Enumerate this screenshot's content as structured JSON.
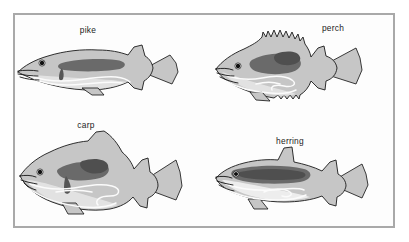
{
  "figure": {
    "type": "anatomical-diagram",
    "background_color": "#ffffff",
    "panel_background": "#fdfdfd",
    "frame_color": "#a9a9a9",
    "frame": {
      "x": 13,
      "y": 13,
      "width": 382,
      "height": 215,
      "stroke_width": 2
    },
    "palette": {
      "body_fill": "#c6c6c6",
      "body_outline": "#1a1a1a",
      "belly_pale": "#e4e4e4",
      "organ_dark": "#6a6a6a",
      "organ_darker": "#4f4f4f",
      "gut_white": "#fbfbfb",
      "label_text": "#1c1c1c",
      "eye_pupil": "#111111"
    },
    "specimens": [
      {
        "id": "pike",
        "label": "pike",
        "label_x": 88,
        "label_y": 33,
        "body_shape": "elongated torpedo",
        "dorsal_fin": "single posterior soft fin",
        "organ_note": "short straight dark gut",
        "quadrant": "top-left"
      },
      {
        "id": "perch",
        "label": "perch",
        "label_x": 333,
        "label_y": 31,
        "body_shape": "deep-bodied",
        "dorsal_fin": "spiny serrated dorsal fin",
        "organ_note": "large dark stomach with looping gut",
        "quadrant": "top-right"
      },
      {
        "id": "carp",
        "label": "carp",
        "label_x": 86,
        "label_y": 128,
        "body_shape": "deep rounded body",
        "dorsal_fin": "long soft dorsal fin",
        "organ_note": "long coiled intestine",
        "quadrant": "bottom-left"
      },
      {
        "id": "herring",
        "label": "herring",
        "label_x": 290,
        "label_y": 144,
        "body_shape": "slender streamlined",
        "dorsal_fin": "short mid dorsal fin",
        "organ_note": "elongated dark organ, short gut",
        "quadrant": "bottom-right"
      }
    ]
  }
}
